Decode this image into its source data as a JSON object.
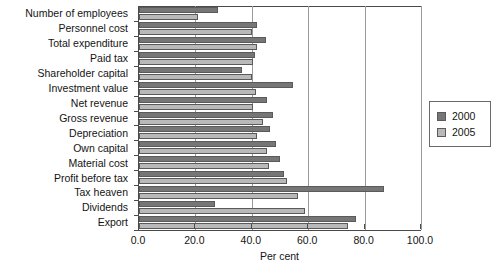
{
  "chart_data": {
    "type": "bar",
    "orientation": "horizontal",
    "title": "",
    "xlabel": "Per cent",
    "ylabel": "",
    "xlim": [
      0.0,
      100.0
    ],
    "xticks": [
      "0.0",
      "20.0",
      "40.0",
      "60.0",
      "80.0",
      "100.0"
    ],
    "xtick_values": [
      0,
      20,
      40,
      60,
      80,
      100
    ],
    "grid": "vertical",
    "legend_position": "right",
    "categories": [
      "Number of employees",
      "Personnel cost",
      "Total expenditure",
      "Paid tax",
      "Shareholder capital",
      "Investment value",
      "Net revenue",
      "Gross revenue",
      "Depreciation",
      "Own capital",
      "Material cost",
      "Profit before tax",
      "Tax heaven",
      "Dividends",
      "Export"
    ],
    "series": [
      {
        "name": "2000",
        "color": "#767676",
        "values": [
          28.0,
          42.0,
          45.0,
          41.0,
          36.5,
          54.5,
          45.5,
          47.5,
          46.5,
          48.5,
          50.0,
          51.5,
          87.0,
          27.0,
          77.0
        ]
      },
      {
        "name": "2005",
        "color": "#b9b9b9",
        "values": [
          21.0,
          40.0,
          42.0,
          40.5,
          40.0,
          41.5,
          40.5,
          44.0,
          42.0,
          45.5,
          46.0,
          52.5,
          56.5,
          59.0,
          74.0
        ]
      }
    ]
  },
  "legend": {
    "items": [
      {
        "label": "2000",
        "color": "#767676"
      },
      {
        "label": "2005",
        "color": "#b9b9b9"
      }
    ]
  }
}
